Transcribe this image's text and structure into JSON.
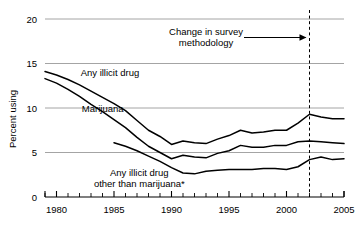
{
  "chart_data": {
    "type": "line",
    "title": "",
    "xlabel": "",
    "ylabel": "Percent using",
    "xlim": [
      1979,
      2005
    ],
    "ylim": [
      0,
      20
    ],
    "yticks": [
      0,
      5,
      10,
      15,
      20
    ],
    "ytick_labels": [
      "0",
      "5",
      "10",
      "15",
      "20"
    ],
    "xticks": [
      1980,
      1985,
      1990,
      1995,
      2000,
      2005
    ],
    "xtick_labels": [
      "1980",
      "1985",
      "1990",
      "1995",
      "2000",
      "2005"
    ],
    "xtick_minor_step": 1,
    "grid": "horizontal",
    "legend_position": "inline-labels",
    "line_color": "#000000",
    "grid_color": "#9a9a9a",
    "axis_color": "#000000",
    "series": [
      {
        "name": "Any illicit drug",
        "label": "Any illicit drug",
        "label_x": 1982.1,
        "label_y": 13.6,
        "x": [
          1979,
          1980,
          1981,
          1982,
          1983,
          1984,
          1985,
          1986,
          1987,
          1988,
          1989,
          1990,
          1991,
          1992,
          1993,
          1994,
          1995,
          1996,
          1997,
          1998,
          1999,
          2000,
          2001,
          2002,
          2003,
          2004,
          2005
        ],
        "y": [
          14.1,
          13.7,
          13.2,
          12.6,
          11.9,
          11.2,
          10.5,
          9.7,
          8.6,
          7.5,
          6.8,
          5.9,
          6.3,
          6.1,
          6.0,
          6.5,
          6.9,
          7.5,
          7.2,
          7.3,
          7.5,
          7.5,
          8.3,
          9.3,
          9.0,
          8.8,
          8.8
        ]
      },
      {
        "name": "Marijuana",
        "label": "Marijuana",
        "label_x": 1982.2,
        "label_y": 9.5,
        "x": [
          1979,
          1980,
          1981,
          1982,
          1983,
          1984,
          1985,
          1986,
          1987,
          1988,
          1989,
          1990,
          1991,
          1992,
          1993,
          1994,
          1995,
          1996,
          1997,
          1998,
          1999,
          2000,
          2001,
          2002,
          2003,
          2004,
          2005
        ],
        "y": [
          13.3,
          12.8,
          12.1,
          11.3,
          10.4,
          9.6,
          8.7,
          7.8,
          6.7,
          5.7,
          5.0,
          4.3,
          4.7,
          4.5,
          4.4,
          4.9,
          5.2,
          5.8,
          5.6,
          5.6,
          5.8,
          5.8,
          6.2,
          6.3,
          6.2,
          6.1,
          6.0
        ]
      },
      {
        "name": "Any illicit drug other than marijuana*",
        "label": "Any illicit drug\nother than marijuana*",
        "label_line1": "Any illicit drug",
        "label_line2": "other than marijuana*",
        "label_x": 1987.2,
        "label_y": 2.4,
        "x": [
          1985,
          1986,
          1987,
          1988,
          1989,
          1990,
          1991,
          1992,
          1993,
          1994,
          1995,
          1996,
          1997,
          1998,
          1999,
          2000,
          2001,
          2002,
          2003,
          2004,
          2005
        ],
        "y": [
          6.1,
          5.7,
          5.2,
          4.6,
          4.0,
          3.3,
          2.7,
          2.6,
          2.9,
          3.0,
          3.1,
          3.1,
          3.1,
          3.2,
          3.2,
          3.1,
          3.4,
          4.2,
          4.5,
          4.2,
          4.3
        ]
      }
    ],
    "annotations": [
      {
        "name": "methodology-change",
        "text_line1": "Change in survey",
        "text_line2": "methodology",
        "arrow": true,
        "points_to_x": 2002,
        "vline_x": 2002,
        "vline_style": "dashed"
      }
    ]
  }
}
